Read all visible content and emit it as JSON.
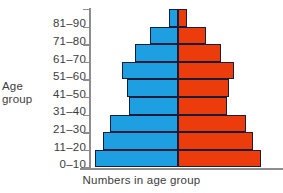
{
  "chart_data": {
    "type": "bar",
    "subtype": "population-pyramid",
    "title": "",
    "xlabel": "Numbers in age group",
    "ylabel": "Age group",
    "grid": false,
    "legend": null,
    "orientation": "horizontal",
    "axis_of_symmetry": true,
    "categories": [
      "81–90",
      "71–80",
      "61–70",
      "51–60",
      "41–50",
      "31–40",
      "21–30",
      "11–20",
      "0–10"
    ],
    "series": [
      {
        "name": "left",
        "color": "#1e9fe2",
        "values": [
          1.0,
          3.0,
          4.6,
          6.0,
          5.5,
          5.3,
          7.3,
          8.1,
          8.9
        ]
      },
      {
        "name": "right",
        "color": "#ec3c0c",
        "values": [
          1.0,
          3.0,
          4.6,
          6.0,
          5.5,
          5.3,
          7.3,
          8.1,
          8.9
        ]
      }
    ],
    "bars": [
      {
        "category": "81–90",
        "left_value": 1.0,
        "right_value": 1.0
      },
      {
        "category": "71–80",
        "left_value": 3.0,
        "right_value": 3.0
      },
      {
        "category": "61–70",
        "left_value": 4.6,
        "right_value": 4.6
      },
      {
        "category": "51–60",
        "left_value": 6.0,
        "right_value": 6.0
      },
      {
        "category": "41–50",
        "left_value": 5.5,
        "right_value": 5.5
      },
      {
        "category": "31–40",
        "left_value": 5.3,
        "right_value": 5.3
      },
      {
        "category": "21–30",
        "left_value": 7.3,
        "right_value": 7.3
      },
      {
        "category": "11–20",
        "left_value": 8.1,
        "right_value": 8.1
      },
      {
        "category": "0–10",
        "left_value": 8.9,
        "right_value": 8.9
      }
    ],
    "xlim": [
      -10,
      10
    ],
    "max_value": 10
  },
  "axes": {
    "y_title_line1": "Age",
    "y_title_line2": "group",
    "x_title": "Numbers in age group"
  },
  "colors": {
    "left_bar": "#1e9fe2",
    "right_bar": "#ec3c0c",
    "bar_outline": "#1b1b3a",
    "axis": "#8d8d8d",
    "text": "#3c3c3c",
    "background": "#ffffff"
  }
}
